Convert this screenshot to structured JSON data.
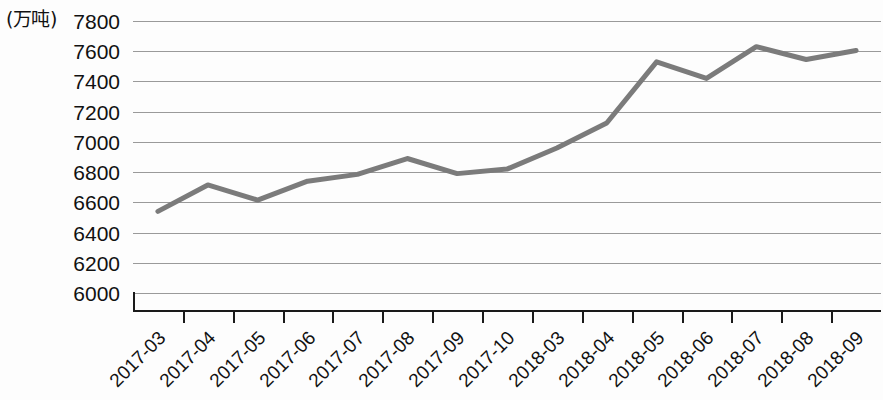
{
  "chart_data": {
    "type": "line",
    "title": "",
    "subtitle": "",
    "xlabel": "",
    "ylabel": "",
    "unit_label": "(万吨)",
    "categories": [
      "2017-03",
      "2017-04",
      "2017-05",
      "2017-06",
      "2017-07",
      "2017-08",
      "2017-09",
      "2017-10",
      "2018-03",
      "2018-04",
      "2018-05",
      "2018-06",
      "2018-07",
      "2018-08",
      "2018-09"
    ],
    "values": [
      6540,
      6715,
      6615,
      6740,
      6785,
      6890,
      6790,
      6820,
      6960,
      7125,
      7530,
      7420,
      7630,
      7545,
      7605
    ],
    "y_ticks": [
      6000,
      6200,
      6400,
      6600,
      6800,
      7000,
      7200,
      7400,
      7600,
      7800
    ],
    "ylim": [
      6000,
      7800
    ],
    "grid": true,
    "legend": "none",
    "series_color": "#7b7b7b",
    "grid_color": "#9a9a9a",
    "axis_color": "#1a1a1a",
    "series": [
      {
        "name": "产量",
        "values": [
          6540,
          6715,
          6615,
          6740,
          6785,
          6890,
          6790,
          6820,
          6960,
          7125,
          7530,
          7420,
          7630,
          7545,
          7605
        ]
      }
    ]
  }
}
